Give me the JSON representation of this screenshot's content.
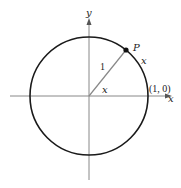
{
  "diagram": {
    "type": "unit-circle",
    "axes": {
      "x_label": "x",
      "y_label": "y"
    },
    "circle": {
      "center": [
        89,
        96
      ],
      "radius": 59,
      "stroke": "#1a1a1a"
    },
    "radius_segment": {
      "label": "1",
      "stroke": "#888888"
    },
    "angle_label": "x",
    "arc_label": "x",
    "point": {
      "label": "P"
    },
    "intercept_label": "(1, 0)",
    "colors": {
      "axis": "#888888",
      "circle": "#1a1a1a",
      "text": "#222222"
    }
  }
}
